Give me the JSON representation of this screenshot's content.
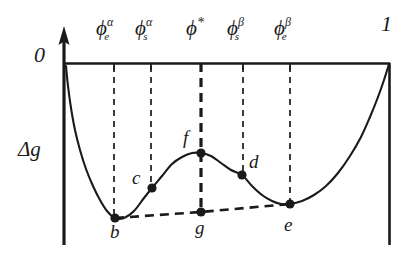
{
  "figure": {
    "axes": {
      "y_label": "Δg",
      "origin_label": "0",
      "right_label": "1",
      "x_axis_y": 63,
      "y_axis_x": 64,
      "right_axis_x": 390,
      "bottom_y": 245
    },
    "tick_labels": [
      {
        "name": "phi-e-alpha",
        "base": "ϕ",
        "sup": "α",
        "sub": "e",
        "x": 114,
        "label_x": 96,
        "label_y": 18
      },
      {
        "name": "phi-s-alpha",
        "base": "ϕ",
        "sup": "α",
        "sub": "s",
        "x": 151,
        "label_x": 135,
        "label_y": 18
      },
      {
        "name": "phi-star",
        "base": "ϕ",
        "sup": "*",
        "sub": "",
        "x": 201,
        "label_x": 186,
        "label_y": 18
      },
      {
        "name": "phi-s-beta",
        "base": "ϕ",
        "sup": "β",
        "sub": "s",
        "x": 243,
        "label_x": 227,
        "label_y": 18
      },
      {
        "name": "phi-e-beta",
        "base": "ϕ",
        "sup": "β",
        "sub": "e",
        "x": 290,
        "label_x": 274,
        "label_y": 18
      }
    ],
    "points": [
      {
        "name": "b",
        "label": "b",
        "x": 115,
        "y": 218,
        "label_x": 110,
        "label_y": 222,
        "role": "alpha-binodal-minimum"
      },
      {
        "name": "c",
        "label": "c",
        "x": 152,
        "y": 188,
        "label_x": 132,
        "label_y": 168,
        "role": "alpha-spinodal"
      },
      {
        "name": "f",
        "label": "f",
        "x": 201,
        "y": 153,
        "label_x": 183,
        "label_y": 128,
        "role": "barrier-maximum"
      },
      {
        "name": "d",
        "label": "d",
        "x": 242,
        "y": 175,
        "label_x": 249,
        "label_y": 152,
        "role": "beta-spinodal"
      },
      {
        "name": "e",
        "label": "e",
        "x": 290,
        "y": 204,
        "label_x": 284,
        "label_y": 215,
        "role": "beta-binodal-minimum"
      },
      {
        "name": "g",
        "label": "g",
        "x": 201,
        "y": 212,
        "label_x": 195,
        "label_y": 218,
        "role": "tie-line-point"
      }
    ],
    "curve_label": "free-energy-curve",
    "tieline_label": "common-tangent-tie-line",
    "colors": {
      "ink": "#1a1a1a",
      "background": "#ffffff"
    }
  },
  "chart_data": {
    "type": "line",
    "title": "",
    "xlabel": "",
    "ylabel": "Δg",
    "xlim": [
      0,
      1
    ],
    "ylim": [
      0,
      1
    ],
    "grid": false,
    "legend": null,
    "axis_tick_labels": {
      "x": [
        "0",
        "ϕeα",
        "ϕsα",
        "ϕ*",
        "ϕsβ",
        "ϕeβ",
        "1"
      ],
      "y": [
        "0"
      ]
    },
    "annotations": [
      {
        "label": "b",
        "x": 0.156,
        "y": 0.852
      },
      {
        "label": "c",
        "x": 0.27,
        "y": 0.687
      },
      {
        "label": "f",
        "x": 0.42,
        "y": 0.495
      },
      {
        "label": "d",
        "x": 0.546,
        "y": 0.615
      },
      {
        "label": "e",
        "x": 0.693,
        "y": 0.775
      },
      {
        "label": "g",
        "x": 0.42,
        "y": 0.819
      }
    ],
    "series": [
      {
        "name": "free-energy-curve",
        "style": "solid",
        "points": [
          [
            66,
            66
          ],
          [
            68,
            86
          ],
          [
            71,
            108
          ],
          [
            75,
            130
          ],
          [
            80,
            150
          ],
          [
            86,
            169
          ],
          [
            93,
            186
          ],
          [
            100,
            200
          ],
          [
            107,
            211
          ],
          [
            115,
            218
          ],
          [
            124,
            218
          ],
          [
            134,
            211
          ],
          [
            144,
            198
          ],
          [
            152,
            188
          ],
          [
            162,
            176
          ],
          [
            172,
            164
          ],
          [
            182,
            157
          ],
          [
            192,
            153
          ],
          [
            201,
            153
          ],
          [
            211,
            156
          ],
          [
            221,
            163
          ],
          [
            231,
            170
          ],
          [
            242,
            175
          ],
          [
            252,
            186
          ],
          [
            262,
            195
          ],
          [
            272,
            201
          ],
          [
            281,
            204
          ],
          [
            290,
            204
          ],
          [
            302,
            201
          ],
          [
            314,
            195
          ],
          [
            326,
            186
          ],
          [
            338,
            173
          ],
          [
            350,
            156
          ],
          [
            361,
            137
          ],
          [
            370,
            117
          ],
          [
            378,
            97
          ],
          [
            384,
            80
          ],
          [
            389,
            64
          ]
        ]
      },
      {
        "name": "common-tangent-tie-line",
        "style": "dashed",
        "points": [
          [
            115,
            218
          ],
          [
            201,
            212
          ],
          [
            290,
            204
          ]
        ]
      },
      {
        "name": "vertical-drop-phi-star",
        "style": "dashed-thick",
        "points": [
          [
            201,
            63
          ],
          [
            201,
            212
          ]
        ]
      }
    ]
  }
}
